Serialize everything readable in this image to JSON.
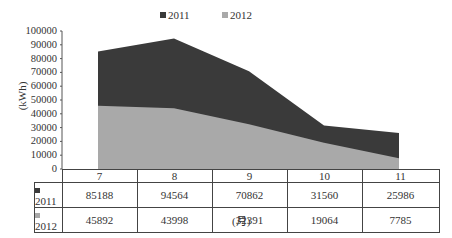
{
  "chart_data": {
    "type": "area",
    "title": "",
    "xlabel": "(月)",
    "ylabel": "(kWh)",
    "categories": [
      "7",
      "8",
      "9",
      "10",
      "11"
    ],
    "series": [
      {
        "name": "2011",
        "values": [
          85188,
          94564,
          70862,
          31560,
          25986
        ],
        "color": "#3a3a3a"
      },
      {
        "name": "2012",
        "values": [
          45892,
          43998,
          32391,
          19064,
          7785
        ],
        "color": "#a9a9a9"
      }
    ],
    "ylim": [
      0,
      100000
    ],
    "yticks": [
      "100000",
      "90000",
      "80000",
      "70000",
      "60000",
      "50000",
      "40000",
      "30000",
      "20000",
      "10000",
      "0"
    ],
    "grid": false,
    "legend_position": "top",
    "data_table": true
  },
  "legend": [
    {
      "label": "2011",
      "color": "#3a3a3a"
    },
    {
      "label": "2012",
      "color": "#a9a9a9"
    }
  ],
  "table": {
    "rows": [
      {
        "label": "2011",
        "values": [
          "85188",
          "94564",
          "70862",
          "31560",
          "25986"
        ]
      },
      {
        "label": "2012",
        "values": [
          "45892",
          "43998",
          "32391",
          "19064",
          "7785"
        ]
      }
    ]
  }
}
